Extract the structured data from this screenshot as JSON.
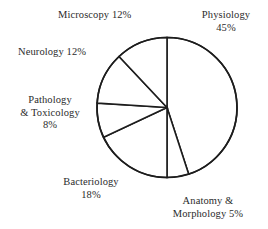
{
  "chart_data": {
    "type": "pie",
    "title": "",
    "subtitle": "",
    "xlabel": "",
    "ylabel": "",
    "legend_position": "none",
    "grid": false,
    "labels_outside": true,
    "start_angle_deg": 0,
    "direction": "clockwise",
    "categories": [
      "Physiology",
      "Anatomy & Morphology",
      "Bacteriology",
      "Pathology & Toxicology",
      "Neurology",
      "Microscopy"
    ],
    "values": [
      45,
      5,
      18,
      8,
      12,
      12
    ],
    "units": "percent",
    "total": 100,
    "slice_fill": "#ffffff",
    "slice_stroke": "#1d1d1d",
    "slices": [
      {
        "name": "Physiology",
        "value": 45,
        "angle_deg": 162,
        "start_deg": 0,
        "end_deg": 162
      },
      {
        "name": "Anatomy & Morphology",
        "value": 5,
        "angle_deg": 18,
        "start_deg": 162,
        "end_deg": 180
      },
      {
        "name": "Bacteriology",
        "value": 18,
        "angle_deg": 64.8,
        "start_deg": 180,
        "end_deg": 244.8
      },
      {
        "name": "Pathology & Toxicology",
        "value": 8,
        "angle_deg": 28.8,
        "start_deg": 244.8,
        "end_deg": 273.6
      },
      {
        "name": "Neurology",
        "value": 12,
        "angle_deg": 43.2,
        "start_deg": 273.6,
        "end_deg": 316.8
      },
      {
        "name": "Microscopy",
        "value": 12,
        "angle_deg": 43.2,
        "start_deg": 316.8,
        "end_deg": 360
      }
    ]
  },
  "labels": {
    "microscopy": {
      "line1": "Microscopy  12%"
    },
    "physiology": {
      "line1": "Physiology",
      "line2": "45%"
    },
    "neurology": {
      "line1": "Neurology  12%"
    },
    "pathology": {
      "line1": "Pathology",
      "line2": "& Toxicology",
      "line3": "8%"
    },
    "bacteriology": {
      "line1": "Bacteriology",
      "line2": "18%"
    },
    "anatomy": {
      "line1": "Anatomy &",
      "line2": "Morphology  5%"
    }
  },
  "colors": {
    "background": "#ffffff",
    "stroke": "#1d1d1d",
    "text": "#2b2b2b"
  }
}
